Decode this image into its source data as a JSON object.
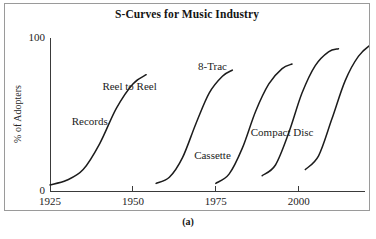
{
  "figure": {
    "caption": "(a)",
    "border_color": "#9a9a9a",
    "background": "#ffffff"
  },
  "chart_data": {
    "type": "line",
    "title": "S-Curves for Music Industry",
    "xlabel": "",
    "ylabel": "% of Adopters",
    "xlim": [
      1925,
      2020
    ],
    "ylim": [
      0,
      100
    ],
    "grid": false,
    "legend": "inline-annotations",
    "xticks": [
      1925,
      1950,
      1975,
      2000
    ],
    "xtick_labels": [
      "1925",
      "1950",
      "1975",
      "2000"
    ],
    "yticks": [
      0,
      100
    ],
    "ytick_labels": [
      "0",
      "100"
    ],
    "curve_color": "#1c1c1c",
    "series": [
      {
        "name": "Records",
        "label": "Records",
        "label_x": 1937,
        "label_y": 43,
        "x": [
          1925,
          1930,
          1935,
          1940,
          1945,
          1950,
          1954
        ],
        "y": [
          4,
          7,
          14,
          31,
          54,
          70,
          76
        ]
      },
      {
        "name": "Reel to Reel",
        "label": "Reel to Reel",
        "label_x": 1949,
        "label_y": 66,
        "x": [
          1957,
          1961,
          1965,
          1969,
          1973,
          1977,
          1980
        ],
        "y": [
          5,
          9,
          22,
          44,
          64,
          75,
          79
        ]
      },
      {
        "name": "8-Trac",
        "label": "8-Trac",
        "label_x": 1974,
        "label_y": 79,
        "x": [
          1975,
          1979,
          1983,
          1987,
          1991,
          1995,
          1998
        ],
        "y": [
          5,
          11,
          28,
          52,
          70,
          80,
          83
        ]
      },
      {
        "name": "Cassette",
        "label": "Cassette",
        "label_x": 1974,
        "label_y": 21,
        "x": [
          1989,
          1993,
          1997,
          2001,
          2005,
          2009,
          2012
        ],
        "y": [
          10,
          17,
          38,
          64,
          82,
          91,
          93
        ]
      },
      {
        "name": "Compact Disc",
        "label": "Compact Disc",
        "label_x": 1995,
        "label_y": 36,
        "x": [
          2002,
          2006,
          2010,
          2014,
          2018,
          2022,
          2025
        ],
        "y": [
          14,
          23,
          47,
          72,
          88,
          96,
          98
        ]
      }
    ]
  }
}
